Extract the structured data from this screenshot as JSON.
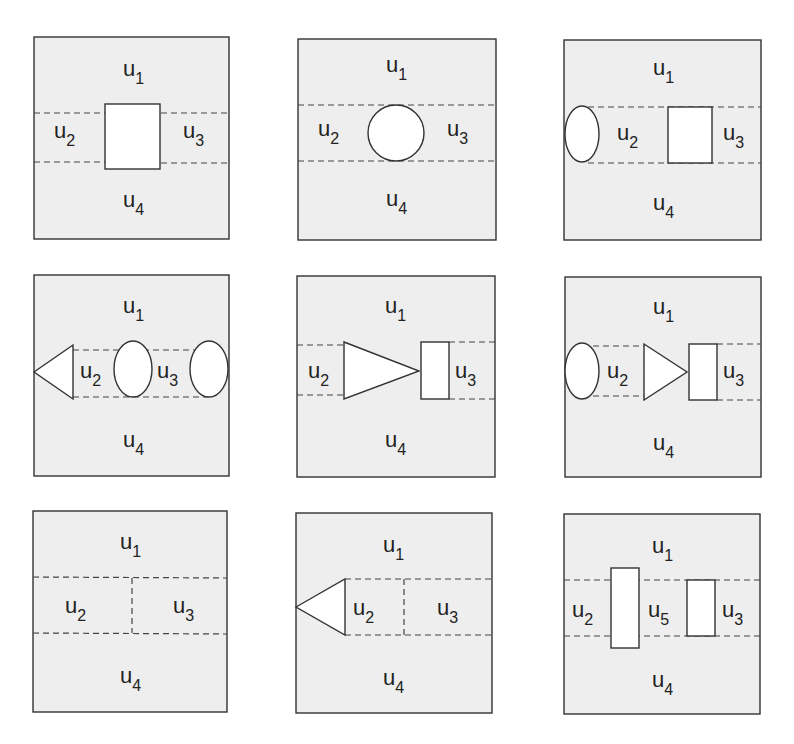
{
  "figure": {
    "colors": {
      "panel_fill": "#eeeeee",
      "border": "#333333",
      "obstacle_fill": "#ffffff",
      "text": "#222222"
    },
    "panels": [
      {
        "id": 1,
        "labels": [
          {
            "base": "u",
            "sub": "1"
          },
          {
            "base": "u",
            "sub": "2"
          },
          {
            "base": "u",
            "sub": "3"
          },
          {
            "base": "u",
            "sub": "4"
          }
        ],
        "obstacles": [
          "rectangle (center)"
        ]
      },
      {
        "id": 2,
        "labels": [
          {
            "base": "u",
            "sub": "1"
          },
          {
            "base": "u",
            "sub": "2"
          },
          {
            "base": "u",
            "sub": "3"
          },
          {
            "base": "u",
            "sub": "4"
          }
        ],
        "obstacles": [
          "circle (center)"
        ]
      },
      {
        "id": 3,
        "labels": [
          {
            "base": "u",
            "sub": "1"
          },
          {
            "base": "u",
            "sub": "2"
          },
          {
            "base": "u",
            "sub": "3"
          },
          {
            "base": "u",
            "sub": "4"
          }
        ],
        "obstacles": [
          "ellipse (left edge)",
          "rectangle (right-center)"
        ]
      },
      {
        "id": 4,
        "labels": [
          {
            "base": "u",
            "sub": "1"
          },
          {
            "base": "u",
            "sub": "2"
          },
          {
            "base": "u",
            "sub": "3"
          },
          {
            "base": "u",
            "sub": "4"
          }
        ],
        "obstacles": [
          "triangle pointing left (left edge)",
          "ellipse (center)",
          "ellipse (right edge)"
        ]
      },
      {
        "id": 5,
        "labels": [
          {
            "base": "u",
            "sub": "1"
          },
          {
            "base": "u",
            "sub": "2"
          },
          {
            "base": "u",
            "sub": "3"
          },
          {
            "base": "u",
            "sub": "4"
          }
        ],
        "obstacles": [
          "triangle pointing right",
          "rectangle"
        ]
      },
      {
        "id": 6,
        "labels": [
          {
            "base": "u",
            "sub": "1"
          },
          {
            "base": "u",
            "sub": "2"
          },
          {
            "base": "u",
            "sub": "3"
          },
          {
            "base": "u",
            "sub": "4"
          }
        ],
        "obstacles": [
          "ellipse (left edge)",
          "triangle pointing right",
          "rectangle"
        ]
      },
      {
        "id": 7,
        "labels": [
          {
            "base": "u",
            "sub": "1"
          },
          {
            "base": "u",
            "sub": "2"
          },
          {
            "base": "u",
            "sub": "3"
          },
          {
            "base": "u",
            "sub": "4"
          }
        ],
        "obstacles": [],
        "note": "vertical dashed divider between u2 and u3"
      },
      {
        "id": 8,
        "labels": [
          {
            "base": "u",
            "sub": "1"
          },
          {
            "base": "u",
            "sub": "2"
          },
          {
            "base": "u",
            "sub": "3"
          },
          {
            "base": "u",
            "sub": "4"
          }
        ],
        "obstacles": [
          "triangle pointing left (left edge)"
        ],
        "note": "vertical dashed divider between u2 and u3"
      },
      {
        "id": 9,
        "labels": [
          {
            "base": "u",
            "sub": "1"
          },
          {
            "base": "u",
            "sub": "2"
          },
          {
            "base": "u",
            "sub": "5"
          },
          {
            "base": "u",
            "sub": "3"
          },
          {
            "base": "u",
            "sub": "4"
          }
        ],
        "obstacles": [
          "tall rectangle (left-center)",
          "rectangle (right-center)"
        ]
      }
    ]
  }
}
